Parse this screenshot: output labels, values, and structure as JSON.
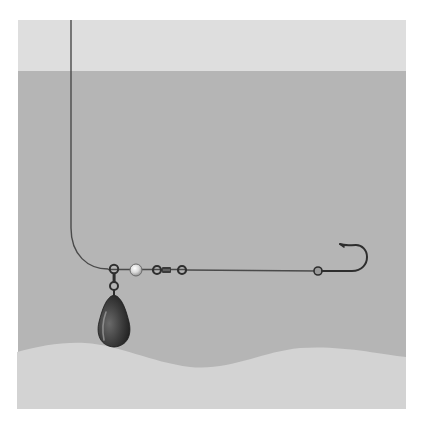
{
  "figure": {
    "title": "Fishing rig diagram: sliding sinker rig with bead, swivel, leader and hook",
    "components": [
      {
        "id": "main-line",
        "label": "Main line"
      },
      {
        "id": "sinker-ring",
        "label": "Snap ring"
      },
      {
        "id": "sinker",
        "label": "Sinker (weight)"
      },
      {
        "id": "bead",
        "label": "Bead"
      },
      {
        "id": "swivel",
        "label": "Barrel swivel"
      },
      {
        "id": "leader",
        "label": "Leader"
      },
      {
        "id": "knot",
        "label": "Knot"
      },
      {
        "id": "hook",
        "label": "Hook"
      }
    ]
  },
  "colors": {
    "background": "#ffffff",
    "sky": "#dedede",
    "water": "#b5b5b5",
    "seabed": "#d3d3d3",
    "line": "#4a4a4a",
    "sinker": "#3c3c3c",
    "sinker_highlight": "#8a8a8a",
    "bead": "#d8d8d8",
    "metal": "#3a3a3a"
  }
}
